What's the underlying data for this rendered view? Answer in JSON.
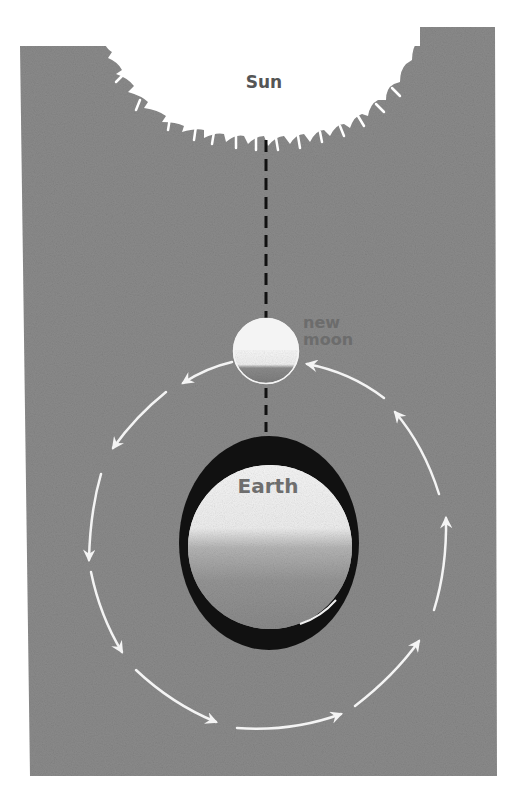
{
  "diagram": {
    "labels": {
      "sun": "Sun",
      "moon": "new moon",
      "moon_line1": "new",
      "moon_line2": "moon",
      "earth": "Earth"
    },
    "colors": {
      "background": "#ffffff",
      "panel": "#8b8b8b",
      "sun": "#ffffff",
      "orbit_arrows": "#f4f4f4",
      "earth_shadow_ring": "#111111",
      "earth_lit": "#f2f2f2",
      "earth_dark": "#8f8f8f",
      "moon_lit": "#f4f4f4",
      "moon_dark": "#7d7d7d",
      "alignment_line": "#111111"
    },
    "orbit_direction": "counter-clockwise",
    "arrow_count": 10
  }
}
